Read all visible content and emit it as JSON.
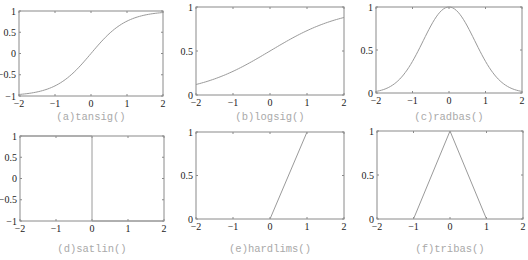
{
  "colors": {
    "frame": "#8a8a8a",
    "curve": "#9a9a9a",
    "caption": "#a9a9a9",
    "tick_text": "#222222"
  },
  "chart_data": [
    {
      "type": "line",
      "title": "(a) tansig()",
      "caption": "(a)tansig()",
      "xlim": [
        -2,
        2
      ],
      "ylim": [
        -1,
        1
      ],
      "xticks": [
        "-2",
        "-1",
        "0",
        "1",
        "2"
      ],
      "yticks": [
        "-1",
        "-0.5",
        "0",
        "0.5",
        "1"
      ],
      "x": [
        -2,
        -1.5,
        -1,
        -0.5,
        0,
        0.5,
        1,
        1.5,
        2
      ],
      "y": [
        -0.96,
        -0.91,
        -0.76,
        -0.46,
        0,
        0.46,
        0.76,
        0.91,
        0.96
      ],
      "function": "tanh(x)"
    },
    {
      "type": "line",
      "title": "(b) logsig()",
      "caption": "(b)logsig()",
      "xlim": [
        -2,
        2
      ],
      "ylim": [
        0,
        1
      ],
      "xticks": [
        "-2",
        "-1",
        "0",
        "1",
        "2"
      ],
      "yticks": [
        "0",
        "0.5",
        "1"
      ],
      "x": [
        -2,
        -1.5,
        -1,
        -0.5,
        0,
        0.5,
        1,
        1.5,
        2
      ],
      "y": [
        0.12,
        0.18,
        0.27,
        0.38,
        0.5,
        0.62,
        0.73,
        0.82,
        0.88
      ],
      "function": "1/(1+exp(-x))"
    },
    {
      "type": "line",
      "title": "(c) radbas()",
      "caption": "(c)radbas()",
      "xlim": [
        -2,
        2
      ],
      "ylim": [
        0,
        1
      ],
      "xticks": [
        "-2",
        "-1",
        "0",
        "1",
        "2"
      ],
      "yticks": [
        "0",
        "0.5",
        "1"
      ],
      "x": [
        -2,
        -1.5,
        -1,
        -0.5,
        0,
        0.5,
        1,
        1.5,
        2
      ],
      "y": [
        0.02,
        0.11,
        0.37,
        0.78,
        1,
        0.78,
        0.37,
        0.11,
        0.02
      ],
      "function": "exp(-x^2)"
    },
    {
      "type": "line",
      "title": "(d) satlin()",
      "caption": "(d)satlin()",
      "xlim": [
        -2,
        2
      ],
      "ylim": [
        -1,
        1
      ],
      "xticks": [
        "-2",
        "-1",
        "0",
        "1",
        "2"
      ],
      "yticks": [
        "-1",
        "-0.5",
        "0",
        "0.5",
        "1"
      ],
      "x": [
        -2,
        0,
        0,
        2
      ],
      "y": [
        1,
        1,
        -1,
        -1
      ]
    },
    {
      "type": "line",
      "title": "(e) hardlims()",
      "caption": "(e)hardlims()",
      "xlim": [
        -2,
        2
      ],
      "ylim": [
        0,
        1
      ],
      "xticks": [
        "-2",
        "-1",
        "0",
        "1",
        "2"
      ],
      "yticks": [
        "0",
        "0.5",
        "1"
      ],
      "x": [
        0,
        1
      ],
      "y": [
        0,
        1
      ]
    },
    {
      "type": "line",
      "title": "(f) tribas()",
      "caption": "(f)tribas()",
      "xlim": [
        -2,
        2
      ],
      "ylim": [
        0,
        1
      ],
      "xticks": [
        "-2",
        "-1",
        "0",
        "1",
        "2"
      ],
      "yticks": [
        "0",
        "0.5",
        "1"
      ],
      "x": [
        -1,
        0,
        1
      ],
      "y": [
        0,
        1,
        0
      ]
    }
  ]
}
